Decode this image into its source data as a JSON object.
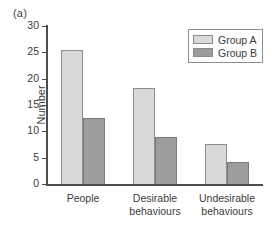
{
  "figure": {
    "panel_label": "(a)"
  },
  "chart_data": {
    "type": "bar",
    "title": "",
    "xlabel": "",
    "ylabel": "Number",
    "ylim": [
      0,
      30
    ],
    "yticks": [
      0,
      5,
      10,
      15,
      20,
      25,
      30
    ],
    "ytick_labels": [
      "0",
      "5",
      "10",
      "15",
      "20",
      "25",
      "30"
    ],
    "grid": false,
    "legend_position": "top-right",
    "categories": [
      "People",
      "Desirable behaviours",
      "Undesirable behaviours"
    ],
    "category_lines": [
      [
        "People"
      ],
      [
        "Desirable",
        "behaviours"
      ],
      [
        "Undesirable",
        "behaviours"
      ]
    ],
    "series": [
      {
        "name": "Group A",
        "color": "#d9d9d9",
        "values": [
          25.5,
          18.2,
          7.6
        ]
      },
      {
        "name": "Group B",
        "color": "#9c9c9c",
        "values": [
          12.5,
          9.0,
          4.2
        ]
      }
    ]
  },
  "legend": {
    "items": [
      {
        "label": "Group A"
      },
      {
        "label": "Group B"
      }
    ]
  }
}
